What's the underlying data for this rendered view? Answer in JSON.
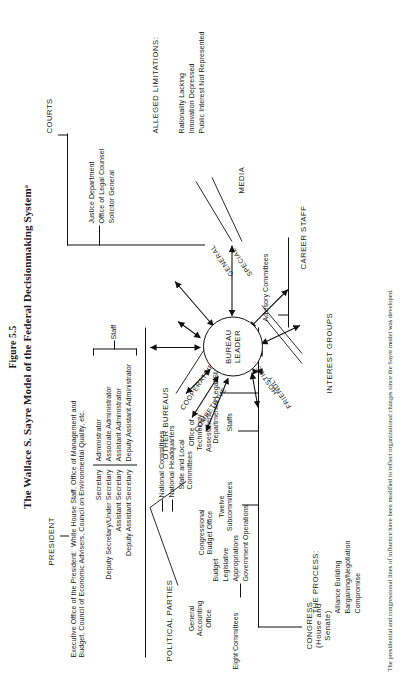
{
  "figure": {
    "number": "Figure 5.5",
    "title": "The Wallace S. Sayre Model of the Federal Decisionmaking Systemᵃ"
  },
  "hub": {
    "line1": "BUREAU",
    "line2": "LEADER"
  },
  "nodes": {
    "president": {
      "label": "PRESIDENT",
      "eop": "Executive Office of the President:  White House Staff, Office of Management and\nBudget, Council of Economic Advisers, Council on Environmental Quality, etc.",
      "dept_titles": [
        "Secretary",
        "Deputy Secretary/Under Secretary",
        "Assistant Secretary",
        "Deputy Assistant Secretary"
      ],
      "staff_titles": [
        "Administrator",
        "Associate Administrator",
        "Assistant Administrator",
        "Deputy Assistant Administrator"
      ],
      "staff_brace_label": "Staff"
    },
    "other_bureaus": {
      "label": "OTHER BUREAUS",
      "relation_competitive": "COMPETITIVE",
      "relation_cooperative": "COOPERATIVE",
      "item": "Departmental Legal Staffs"
    },
    "courts": {
      "label": "COURTS",
      "items": [
        "Justice Department",
        "Office of Legal Counsel",
        "Solicitor General"
      ]
    },
    "limitations": {
      "heading": "ALLEGED LIMITATIONS:",
      "items": [
        "Rationality Lacking",
        "Innovation Depressed",
        "Public Interest Not Represented"
      ]
    },
    "media": {
      "label": "MEDIA",
      "relation_general": "GENERAL",
      "relation_special": "SPECIAL"
    },
    "career_staff": {
      "label": "CAREER STAFF",
      "item": "Advisory Committees"
    },
    "interest_groups": {
      "label": "INTEREST GROUPS",
      "relation_friendly": "FRIENDLY",
      "relation_hostile": "HOSTILE"
    },
    "process": {
      "heading": "THE PROCESS:",
      "items": [
        "Alliance Building",
        "Bargaining/Negotiation",
        "Compromise"
      ]
    },
    "congress": {
      "label": "CONGRESS\n(House and\nSenate)",
      "eight_committees": "Eight Committees",
      "committee_items": [
        "Budget",
        "Legislative",
        "Appropriations",
        "Government Operations"
      ],
      "twelve_subcommittees": "Twelve\nSubcommittees",
      "gao": "General\nAccounting\nOffice",
      "cbo": "Congressional\nBudget Office",
      "ota": "Office of\nTechnology\nAssessment",
      "staffs": "Staffs"
    },
    "political_parties": {
      "label": "POLITICAL PARTIES",
      "items": [
        "National Committees",
        "National Headquarters",
        "State and Local\nCommittees"
      ]
    }
  },
  "footnote": "The presidential and congressional lines of influence have been modified to reflect organizational changes since the Sayre model was developed."
}
